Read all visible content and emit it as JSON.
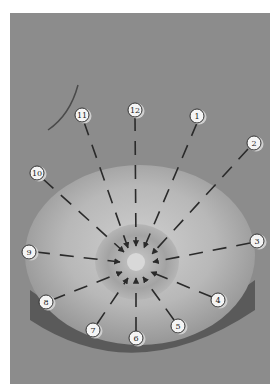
{
  "figure": {
    "colors": {
      "background": "#8c8c8c",
      "highlight": "#cfcfcf",
      "shadow": "#3a3a3a",
      "arrow": "#2a2a2a",
      "label_fill": "#f4f4f4"
    },
    "center": {
      "x": 136,
      "y": 262
    },
    "labels": [
      {
        "text": "1",
        "x": 197,
        "y": 116
      },
      {
        "text": "2",
        "x": 254,
        "y": 143
      },
      {
        "text": "3",
        "x": 257,
        "y": 241
      },
      {
        "text": "4",
        "x": 218,
        "y": 300
      },
      {
        "text": "5",
        "x": 178,
        "y": 326
      },
      {
        "text": "6",
        "x": 136,
        "y": 338
      },
      {
        "text": "7",
        "x": 93,
        "y": 330
      },
      {
        "text": "8",
        "x": 46,
        "y": 302
      },
      {
        "text": "9",
        "x": 29,
        "y": 252
      },
      {
        "text": "10",
        "x": 37,
        "y": 173
      },
      {
        "text": "11",
        "x": 82,
        "y": 115
      },
      {
        "text": "12",
        "x": 135,
        "y": 110
      }
    ]
  }
}
